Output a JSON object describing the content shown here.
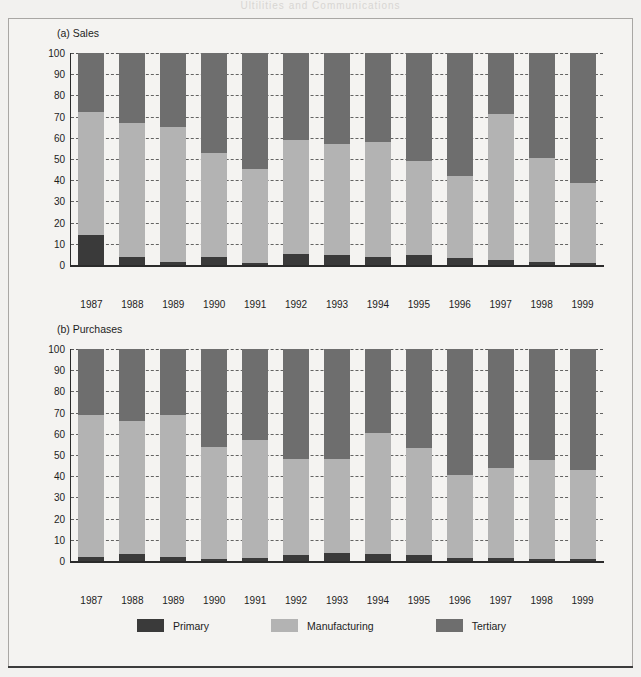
{
  "page": {
    "bleed_text": "Ultilities and Communications"
  },
  "figure": {
    "legend": {
      "items": [
        {
          "label": "Primary",
          "color": "#3a3a3a"
        },
        {
          "label": "Manufacturing",
          "color": "#b3b3b3"
        },
        {
          "label": "Tertiary",
          "color": "#6e6e6e"
        }
      ]
    }
  },
  "chart_data": [
    {
      "type": "bar",
      "stacked": true,
      "title": "(a) Sales",
      "xlabel": "",
      "ylabel": "",
      "ylim": [
        0,
        100
      ],
      "yticks": [
        0,
        10,
        20,
        30,
        40,
        50,
        60,
        70,
        80,
        90,
        100
      ],
      "grid": true,
      "legend_position": "bottom",
      "categories": [
        "1987",
        "1988",
        "1989",
        "1990",
        "1991",
        "1992",
        "1993",
        "1994",
        "1995",
        "1996",
        "1997",
        "1998",
        "1999"
      ],
      "series": [
        {
          "name": "Primary",
          "color": "#3a3a3a",
          "values": [
            14,
            4,
            1.5,
            4,
            1,
            5,
            4.5,
            4,
            4.5,
            3.5,
            2.5,
            1.5,
            1
          ]
        },
        {
          "name": "Manufacturing",
          "color": "#b3b3b3",
          "values": [
            58,
            63,
            63.5,
            49,
            44.5,
            54,
            52.5,
            54,
            44.5,
            38.5,
            68.5,
            49,
            37.5
          ]
        },
        {
          "name": "Tertiary",
          "color": "#6e6e6e",
          "values": [
            28,
            33,
            35,
            47,
            54.5,
            41,
            43,
            42,
            51,
            58,
            29,
            49.5,
            61.5
          ]
        }
      ]
    },
    {
      "type": "bar",
      "stacked": true,
      "title": "(b) Purchases",
      "xlabel": "",
      "ylabel": "",
      "ylim": [
        0,
        100
      ],
      "yticks": [
        0,
        10,
        20,
        30,
        40,
        50,
        60,
        70,
        80,
        90,
        100
      ],
      "grid": true,
      "legend_position": "bottom",
      "categories": [
        "1987",
        "1988",
        "1989",
        "1990",
        "1991",
        "1992",
        "1993",
        "1994",
        "1995",
        "1996",
        "1997",
        "1998",
        "1999"
      ],
      "series": [
        {
          "name": "Primary",
          "color": "#3a3a3a",
          "values": [
            1.8,
            3.5,
            2,
            1,
            1.5,
            3,
            4,
            3.5,
            3,
            1.5,
            1.5,
            0.8,
            0.8
          ]
        },
        {
          "name": "Manufacturing",
          "color": "#b3b3b3",
          "values": [
            67.2,
            62.5,
            67,
            53,
            55.5,
            45,
            44,
            57,
            50.5,
            39,
            42.5,
            47,
            42.2
          ]
        },
        {
          "name": "Tertiary",
          "color": "#6e6e6e",
          "values": [
            31,
            34,
            31,
            46,
            43,
            52,
            52,
            39.5,
            46.5,
            59.5,
            56,
            52.2,
            57
          ]
        }
      ]
    }
  ]
}
